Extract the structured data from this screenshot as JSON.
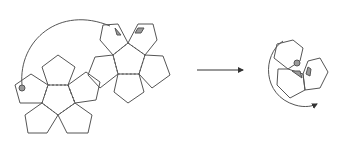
{
  "diagram": {
    "colors": {
      "stroke": "#555555",
      "marker_fill": "#9a9a9a",
      "background": "#ffffff"
    },
    "net": {
      "description": "Unfolded net of two pentagon flowers",
      "left_flower_center": [
        58,
        100
      ],
      "right_flower_center": [
        129,
        62
      ],
      "markers": [
        "circle",
        "triangle",
        "parallelogram"
      ]
    },
    "arrow": {
      "label": "",
      "from": [
        197,
        70
      ],
      "to": [
        245,
        70
      ]
    },
    "folded": {
      "description": "Three pentagons meeting at a vertex with markers, rotation arrow",
      "markers": [
        "circle",
        "triangle",
        "parallelogram"
      ]
    }
  }
}
